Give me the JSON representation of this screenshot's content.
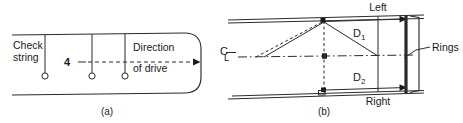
{
  "figure": {
    "panels": [
      {
        "id": "a",
        "caption": "(a)",
        "labels": {
          "check_string": "Check\nstring",
          "check_string_line1": "Check",
          "check_string_line2": "string",
          "direction_line1": "Direction",
          "direction_line2": "of drive",
          "marker_number": "4"
        },
        "markers": [
          {
            "name": "plumb-bob-1",
            "x": 45,
            "y": 76
          },
          {
            "name": "plumb-bob-2",
            "x": 92,
            "y": 76
          },
          {
            "name": "plumb-bob-3",
            "x": 125,
            "y": 76
          }
        ],
        "arrow": {
          "name": "direction-of-drive-arrow",
          "from_x": 88,
          "from_y": 62,
          "to_x": 196,
          "to_y": 62
        }
      },
      {
        "id": "b",
        "caption": "(b)",
        "labels": {
          "centerline": "℄",
          "centerline_c": "C",
          "centerline_l": "L",
          "left": "Left",
          "right": "Right",
          "d1": "D",
          "d1_sub": "1",
          "d2": "D",
          "d2_sub": "2",
          "rings": "Rings"
        }
      }
    ],
    "colors": {
      "ink": "#2b2b2b",
      "ink_dark": "#1a1a1a",
      "paper": "#ffffff"
    }
  }
}
